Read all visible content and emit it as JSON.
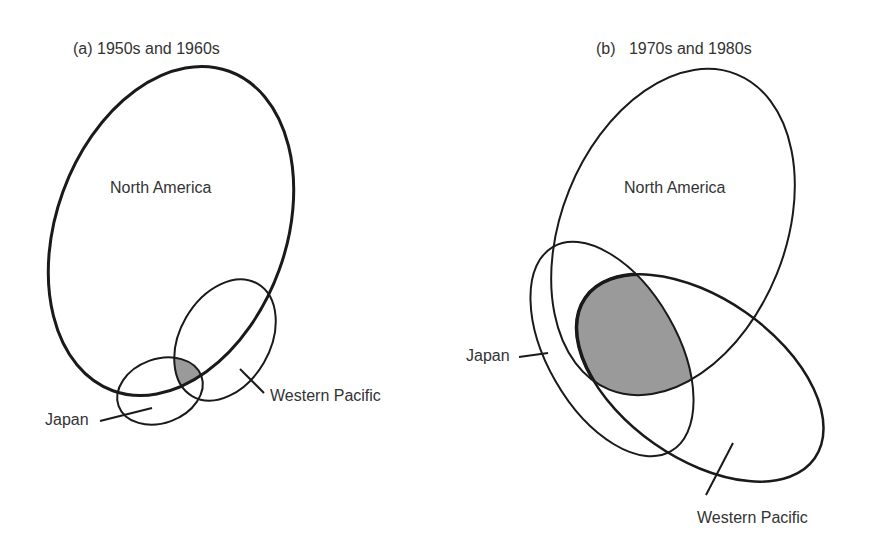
{
  "panels": [
    {
      "id": "a",
      "title": "(a) 1950s and 1960s",
      "labels": {
        "north_america": "North America",
        "japan": "Japan",
        "western_pacific": "Western Pacific"
      }
    },
    {
      "id": "b",
      "title": "(b)   1970s and 1980s",
      "labels": {
        "north_america": "North America",
        "japan": "Japan",
        "western_pacific": "Western Pacific"
      }
    }
  ],
  "colors": {
    "stroke": "#1a1a1a",
    "overlap_fill": "#9a9a9a",
    "text": "#333333"
  }
}
